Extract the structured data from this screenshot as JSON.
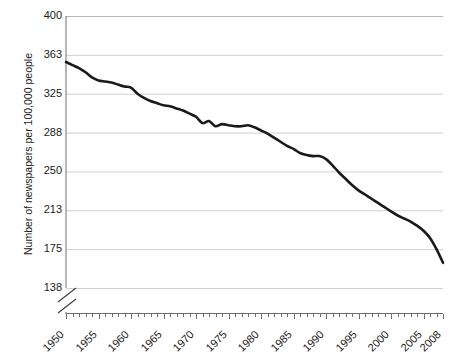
{
  "chart_data": {
    "type": "line",
    "title": "",
    "xlabel": "",
    "ylabel": "Number of newspapers per 100,000 people",
    "xlim": [
      1950,
      2008
    ],
    "ylim": [
      138,
      400
    ],
    "grid": true,
    "legend": null,
    "axis_break": true,
    "y_ticks": [
      400,
      363,
      325,
      288,
      250,
      213,
      175,
      138
    ],
    "x_ticks": [
      1950,
      1955,
      1960,
      1965,
      1970,
      1975,
      1980,
      1985,
      1990,
      1995,
      2000,
      2005,
      2008
    ],
    "x_tick_labels": [
      "1950",
      "1955",
      "1960",
      "1965",
      "1970",
      "1975",
      "1980",
      "1985",
      "1990",
      "1995",
      "2000",
      "2005",
      "2008"
    ],
    "y_tick_labels": [
      "400",
      "363",
      "325",
      "288",
      "250",
      "213",
      "175",
      "138"
    ],
    "series": [
      {
        "name": "Newspapers per 100,000 people",
        "color": "#1a1a1a",
        "x": [
          1950,
          1951,
          1952,
          1953,
          1954,
          1955,
          1956,
          1957,
          1958,
          1959,
          1960,
          1961,
          1962,
          1963,
          1964,
          1965,
          1966,
          1967,
          1968,
          1969,
          1970,
          1971,
          1972,
          1973,
          1974,
          1975,
          1976,
          1977,
          1978,
          1979,
          1980,
          1981,
          1982,
          1983,
          1984,
          1985,
          1986,
          1987,
          1988,
          1989,
          1990,
          1991,
          1992,
          1993,
          1994,
          1995,
          1996,
          1997,
          1998,
          1999,
          2000,
          2001,
          2002,
          2003,
          2004,
          2005,
          2006,
          2007,
          2008
        ],
        "values": [
          356,
          353,
          350,
          346,
          341,
          338,
          337,
          336,
          334,
          332,
          331,
          325,
          321,
          318,
          316,
          314,
          313,
          311,
          309,
          306,
          303,
          297,
          299,
          294,
          296,
          295,
          294,
          294,
          295,
          293,
          290,
          287,
          283,
          279,
          275,
          272,
          268,
          266,
          265,
          265,
          262,
          256,
          249,
          243,
          237,
          232,
          228,
          224,
          220,
          216,
          212,
          208,
          205,
          202,
          198,
          193,
          186,
          175,
          162
        ]
      }
    ]
  },
  "axis": {
    "y_title": "Number of newspapers per 100,000 people"
  }
}
